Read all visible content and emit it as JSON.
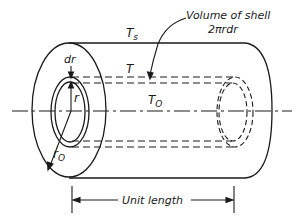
{
  "diagram": {
    "labels": {
      "surface_temp": "T",
      "surface_temp_sub": "s",
      "shell_temp": "T",
      "center_temp": "T",
      "center_temp_sub": "O",
      "shell_thickness": "dr",
      "shell_radius": "r",
      "outer_radius": "r",
      "outer_radius_sub": "O",
      "volume_callout_line1": "Volume of shell",
      "volume_callout_line2": "2πrdr",
      "dimension": "Unit length"
    },
    "colors": {
      "ink": "#1a1a1a",
      "background": "#ffffff"
    }
  }
}
